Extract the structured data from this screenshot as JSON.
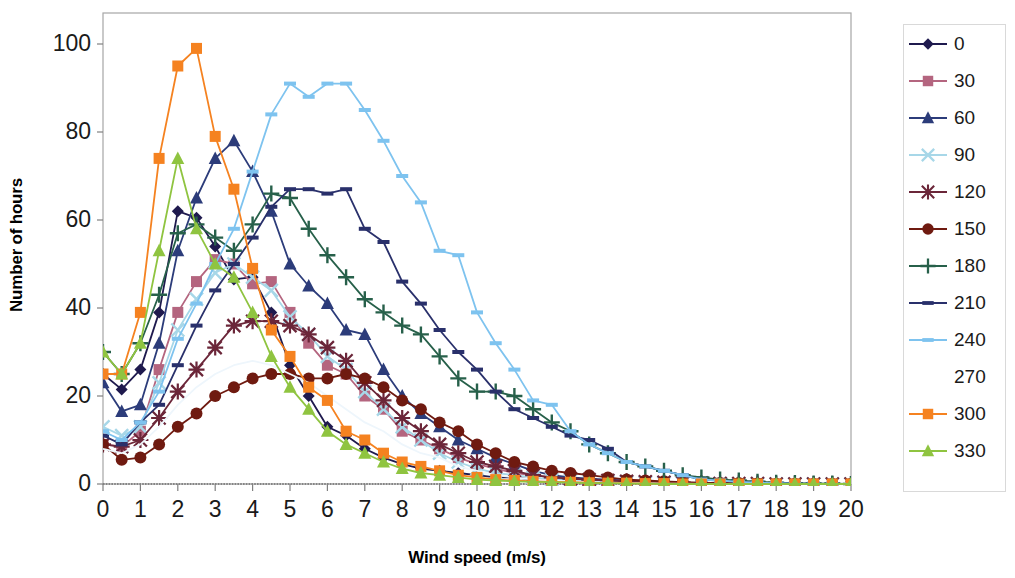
{
  "chart_data": {
    "type": "line",
    "title": "",
    "xlabel": "Wind speed (m/s)",
    "ylabel": "Number of hours",
    "xlim": [
      0,
      20
    ],
    "ylim": [
      0,
      110
    ],
    "xticks": [
      0,
      1,
      2,
      3,
      4,
      5,
      6,
      7,
      8,
      9,
      10,
      11,
      12,
      13,
      14,
      15,
      16,
      17,
      18,
      19,
      20
    ],
    "yticks": [
      0,
      20,
      40,
      60,
      80,
      100
    ],
    "grid": false,
    "legend_position": "right",
    "x": [
      0,
      0.5,
      1,
      1.5,
      2,
      2.5,
      3,
      3.5,
      4,
      4.5,
      5,
      5.5,
      6,
      6.5,
      7,
      7.5,
      8,
      8.5,
      9,
      9.5,
      10,
      10.5,
      11,
      11.5,
      12,
      12.5,
      13,
      13.5,
      14,
      14.5,
      15,
      15.5,
      16,
      16.5,
      17,
      17.5,
      18,
      18.5,
      19,
      19.5,
      20
    ],
    "series": [
      {
        "name": "0",
        "color": "#1f1a4e",
        "marker": "diamond",
        "values": [
          25,
          21.5,
          26,
          39,
          62,
          60.5,
          54,
          46.5,
          47,
          39,
          27,
          20,
          13,
          11,
          8,
          6,
          4.5,
          3.5,
          3,
          2.5,
          2,
          1.5,
          1.5,
          1,
          1,
          1,
          0.8,
          0.6,
          0.5,
          0.4,
          0.3,
          0.2,
          0.2,
          0.1,
          0.1,
          0.1,
          0,
          0,
          0,
          0,
          0
        ]
      },
      {
        "name": "30",
        "color": "#b4657f",
        "marker": "square",
        "values": [
          9,
          8.5,
          12,
          26,
          39,
          46,
          51,
          50,
          45.5,
          46,
          39,
          32,
          27,
          25,
          20,
          17,
          12,
          10,
          8,
          6,
          4.5,
          3.5,
          2.5,
          2,
          1.5,
          1.2,
          1,
          0.8,
          0.6,
          0.5,
          0.4,
          0.3,
          0.2,
          0.2,
          0.1,
          0.1,
          0,
          0,
          0,
          0,
          0
        ]
      },
      {
        "name": "60",
        "color": "#2c3c7a",
        "marker": "triangle",
        "values": [
          23,
          16.5,
          18,
          32,
          53,
          65,
          74,
          78,
          71,
          62,
          50,
          45,
          41,
          35,
          34,
          26,
          20,
          16,
          13,
          10,
          8,
          6,
          4.5,
          3,
          2,
          1.5,
          1.2,
          1,
          0.8,
          0.6,
          0.4,
          0.3,
          0.2,
          0.2,
          0.1,
          0.1,
          0,
          0,
          0,
          0,
          0
        ]
      },
      {
        "name": "90",
        "color": "#a7d7e8",
        "marker": "x",
        "values": [
          13,
          11,
          13,
          23,
          35,
          42,
          48,
          50,
          47,
          44,
          38,
          34,
          29,
          26,
          21,
          17,
          13,
          10,
          7,
          5,
          3.5,
          2.5,
          2,
          1.5,
          1,
          0.8,
          0.6,
          0.5,
          0.4,
          0.3,
          0.2,
          0.2,
          0.1,
          0.1,
          0,
          0,
          0,
          0,
          0,
          0,
          0
        ]
      },
      {
        "name": "120",
        "color": "#6b2639",
        "marker": "star",
        "values": [
          9,
          8.5,
          10,
          15,
          21,
          26,
          31,
          36,
          37,
          37,
          36,
          34,
          31,
          28,
          23,
          19,
          15,
          12,
          9,
          7,
          5,
          4,
          3,
          2,
          1.5,
          1.2,
          1,
          0.8,
          0.6,
          0.5,
          0.4,
          0.3,
          0.2,
          0.1,
          0.1,
          0.1,
          0,
          0,
          0,
          0,
          0
        ]
      },
      {
        "name": "150",
        "color": "#6f1a10",
        "marker": "circle",
        "values": [
          9,
          5.5,
          6,
          9,
          13,
          16,
          20,
          22,
          24,
          25,
          25,
          24,
          24,
          25,
          24,
          22,
          19,
          17,
          14,
          12,
          9,
          7,
          5,
          4,
          3,
          2.5,
          2,
          1.5,
          1,
          0.8,
          0.6,
          0.4,
          0.3,
          0.2,
          0.2,
          0.1,
          0,
          0,
          0,
          0,
          0
        ]
      },
      {
        "name": "180",
        "color": "#27604a",
        "marker": "plus",
        "values": [
          30,
          25,
          32,
          43,
          57,
          59,
          56,
          53,
          59,
          66,
          65,
          58,
          52,
          47,
          42,
          39,
          36,
          34,
          29,
          24,
          21,
          21,
          20,
          17,
          14,
          12,
          9,
          7,
          5,
          4,
          3,
          2,
          1.5,
          1,
          0.8,
          0.5,
          0.3,
          0.2,
          0.1,
          0.1,
          0
        ]
      },
      {
        "name": "210",
        "color": "#29306b",
        "marker": "dash",
        "values": [
          11,
          9,
          14,
          18,
          27,
          36,
          44,
          50,
          56,
          63,
          67,
          67,
          66,
          67,
          58,
          55,
          46,
          41,
          35,
          30,
          26,
          21,
          17,
          15,
          13,
          11,
          10,
          8,
          5,
          4,
          3,
          2,
          1,
          0.8,
          0.5,
          0.3,
          0.2,
          0.1,
          0.1,
          0,
          0
        ]
      },
      {
        "name": "240",
        "color": "#7ec3ef",
        "marker": "dash",
        "values": [
          12,
          10,
          14,
          21,
          33,
          41,
          50,
          58,
          71,
          84,
          91,
          88,
          91,
          91,
          85,
          78,
          70,
          64,
          53,
          52,
          39,
          32,
          26,
          19,
          18,
          12,
          9,
          7,
          5,
          4,
          3,
          2,
          1,
          0.8,
          0.5,
          0.3,
          0.2,
          0.1,
          0,
          0,
          0
        ]
      },
      {
        "name": "270",
        "color": "#eef6fc",
        "marker": "none",
        "values": [
          8,
          7,
          9,
          13,
          18,
          22,
          25,
          27,
          28,
          27,
          25,
          23,
          20,
          17,
          14,
          12,
          9,
          7,
          6,
          4,
          3,
          2,
          1.5,
          1,
          0.8,
          0.6,
          0.4,
          0.3,
          0.2,
          0.2,
          0.1,
          0.1,
          0,
          0,
          0,
          0,
          0,
          0,
          0,
          0,
          0
        ]
      },
      {
        "name": "300",
        "color": "#f58220",
        "marker": "square",
        "values": [
          25,
          25,
          39,
          74,
          95,
          99,
          79,
          67,
          49,
          35,
          29,
          22,
          19,
          12,
          10,
          7,
          5,
          4,
          3,
          2,
          1.5,
          1,
          0.8,
          0.6,
          0.5,
          0.4,
          0.3,
          0.2,
          0.2,
          0.1,
          0.1,
          0,
          0,
          0,
          0,
          0,
          0,
          0,
          0,
          0,
          0
        ]
      },
      {
        "name": "330",
        "color": "#8fc440",
        "marker": "triangle",
        "values": [
          30,
          25,
          32,
          53,
          74,
          58,
          50,
          47,
          39,
          29,
          22,
          17,
          12,
          9,
          7,
          5,
          3.5,
          2.5,
          2,
          1.5,
          1,
          0.8,
          0.6,
          0.5,
          0.4,
          0.3,
          0.2,
          0.2,
          0.1,
          0.1,
          0,
          0,
          0,
          0,
          0,
          0,
          0,
          0,
          0,
          0,
          0
        ]
      }
    ]
  },
  "legend": {
    "items": [
      {
        "label": "0"
      },
      {
        "label": "30"
      },
      {
        "label": "60"
      },
      {
        "label": "90"
      },
      {
        "label": "120"
      },
      {
        "label": "150"
      },
      {
        "label": "180"
      },
      {
        "label": "210"
      },
      {
        "label": "240"
      },
      {
        "label": "270"
      },
      {
        "label": "300"
      },
      {
        "label": "330"
      }
    ]
  }
}
